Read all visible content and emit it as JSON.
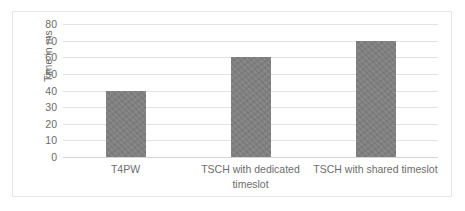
{
  "chart_data": {
    "type": "bar",
    "title": "",
    "xlabel": "",
    "ylabel": "Time in ms",
    "categories": [
      "T4PW",
      "TSCH with dedicated timeslot",
      "TSCH with shared timeslot"
    ],
    "values": [
      40,
      60,
      70
    ],
    "ylim": [
      0,
      80
    ],
    "ytick_step": 10,
    "yticks": [
      "80",
      "70",
      "60",
      "50",
      "40",
      "30",
      "20",
      "10",
      "0"
    ],
    "grid": "horizontal",
    "legend": "none",
    "series": [
      {
        "name": "Time in ms",
        "values": [
          40,
          60,
          70
        ]
      }
    ],
    "colors": {
      "bar": "#808080",
      "gridline": "#e3e3e3",
      "axis_text": "#6d6d6d",
      "frame_border": "#e6e6e6",
      "background": "#ffffff"
    }
  }
}
